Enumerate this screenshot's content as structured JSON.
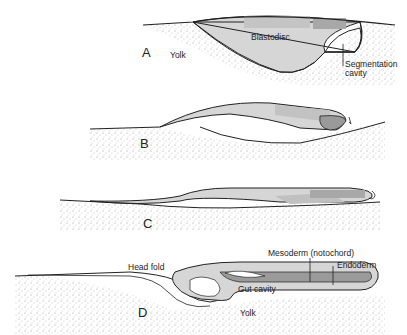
{
  "diagram": {
    "panels": [
      {
        "letter": "A",
        "labels": {
          "blastodisc": "Blastodisc",
          "yolk": "Yolk",
          "cavity_1": "Segmentation",
          "cavity_2": "cavity"
        }
      },
      {
        "letter": "B"
      },
      {
        "letter": "C"
      },
      {
        "letter": "D",
        "labels": {
          "head_fold": "Head fold",
          "mesoderm": "Mesoderm (notochord)",
          "endoderm": "Endoderm",
          "gut": "Gut cavity",
          "yolk": "Yolk"
        }
      }
    ],
    "colors": {
      "light_tissue": "#d6d6d6",
      "mid_tissue": "#bdbdbd",
      "dark_tissue": "#9a9a9a",
      "outline": "#222222",
      "yolk_stipple": "#8a8a8a"
    }
  }
}
